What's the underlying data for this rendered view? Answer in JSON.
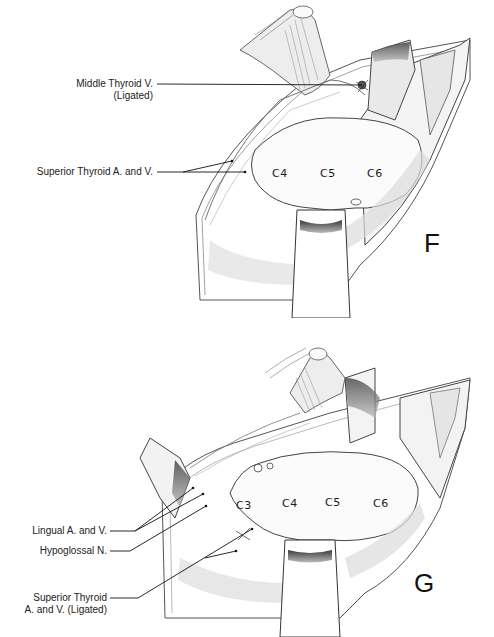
{
  "figure": {
    "panels": [
      {
        "id": "F",
        "letter": "F",
        "labels": [
          {
            "id": "middle-thyroid",
            "line1": "Middle Thyroid V.",
            "line2": "(Ligated)"
          },
          {
            "id": "superior-thyroid",
            "line1": "Superior Thyroid A. and V."
          }
        ],
        "vertebrae": [
          "C4",
          "C5",
          "C6"
        ]
      },
      {
        "id": "G",
        "letter": "G",
        "labels": [
          {
            "id": "lingual",
            "line1": "Lingual A. and V."
          },
          {
            "id": "hypoglossal",
            "line1": "Hypoglossal N."
          },
          {
            "id": "superior-thyroid-ligated",
            "line1": "Superior Thyroid",
            "line2": "A. and V. (Ligated)"
          }
        ],
        "vertebrae": [
          "C3",
          "C4",
          "C5",
          "C6"
        ]
      }
    ],
    "colors": {
      "ink": "#222222",
      "shade": "#9a9a9a",
      "background": "#ffffff"
    }
  }
}
